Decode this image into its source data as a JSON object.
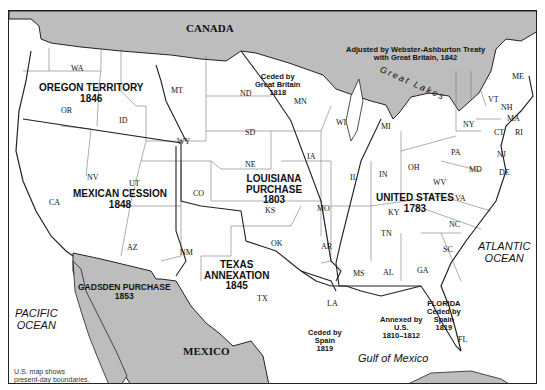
{
  "map": {
    "title": "U.S. Territorial Acquisitions",
    "colors": {
      "land": "#ffffff",
      "foreign": "#bdbdbd",
      "border": "#222222",
      "state_line": "#777777",
      "frame": "#222222"
    },
    "countries": {
      "canada": "CANADA",
      "mexico": "MEXICO"
    },
    "oceans": {
      "pacific": "PACIFIC\nOCEAN",
      "atlantic": "ATLANTIC\nOCEAN",
      "gulf": "Gulf of Mexico",
      "great_lakes": "Great Lakes"
    },
    "regions": {
      "oregon": {
        "name": "OREGON TERRITORY",
        "year": "1846"
      },
      "mexican_cession": {
        "name": "MEXICAN CESSION",
        "year": "1848"
      },
      "louisiana": {
        "name1": "LOUISIANA",
        "name2": "PURCHASE",
        "year": "1803"
      },
      "united_states": {
        "name": "UNITED STATES",
        "year": "1783"
      },
      "texas": {
        "name1": "TEXAS",
        "name2": "ANNEXATION",
        "year": "1845"
      },
      "gadsden": {
        "name": "GADSDEN PURCHASE",
        "year": "1853"
      },
      "florida": {
        "name": "FLORIDA",
        "line2": "Ceded by",
        "line3": "Spain",
        "year": "1819"
      },
      "ceded_britain": {
        "line1": "Ceded by",
        "line2": "Great Britain",
        "year": "1818"
      },
      "ceded_spain": {
        "line1": "Ceded by",
        "line2": "Spain",
        "year": "1819"
      },
      "annexed_us": {
        "line1": "Annexed by",
        "line2": "U.S.",
        "year": "1810–1812"
      },
      "webster": {
        "line1": "Adjusted by Webster-Ashburton Treaty",
        "line2": "with Great Britain, 1842"
      }
    },
    "states": {
      "WA": "WA",
      "OR": "OR",
      "ID": "ID",
      "MT": "MT",
      "WY": "WY",
      "CA": "CA",
      "NV": "NV",
      "UT": "UT",
      "AZ": "AZ",
      "CO": "CO",
      "NM": "NM",
      "ND": "ND",
      "SD": "SD",
      "NE": "NE",
      "KS": "KS",
      "OK": "OK",
      "TX": "TX",
      "MN": "MN",
      "IA": "IA",
      "MO": "MO",
      "AR": "AR",
      "LA": "LA",
      "WI": "WI",
      "IL": "IL",
      "MI": "MI",
      "IN": "IN",
      "OH": "OH",
      "KY": "KY",
      "TN": "TN",
      "MS": "MS",
      "AL": "AL",
      "GA": "GA",
      "FL": "FL",
      "SC": "SC",
      "NC": "NC",
      "VA": "VA",
      "WV": "WV",
      "PA": "PA",
      "NY": "NY",
      "NJ": "NJ",
      "DE": "DE",
      "MD": "MD",
      "CT": "CT",
      "RI": "RI",
      "MA": "MA",
      "VT": "VT",
      "NH": "NH",
      "ME": "ME"
    },
    "note": {
      "line1": "U.S. map shows",
      "line2": "present-day boundaries."
    }
  }
}
